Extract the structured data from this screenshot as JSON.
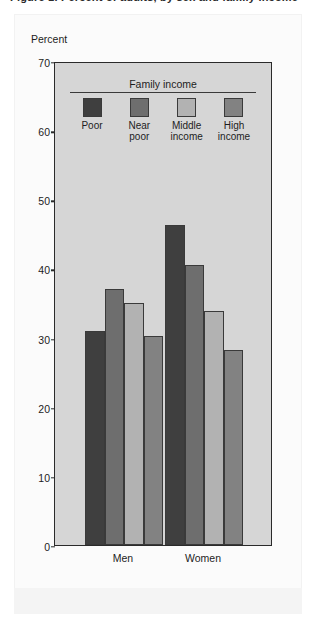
{
  "figure": {
    "clipped_title": "Figure 1. Percent of adults, by sex and family income",
    "background_color": "#fbfbfb"
  },
  "chart_data": {
    "type": "bar",
    "title": "",
    "xlabel": "",
    "ylabel": "Percent",
    "categories": [
      "Men",
      "Women"
    ],
    "series": [
      {
        "name": "Poor",
        "color": "#3f3f3f",
        "values": [
          31.0,
          46.3
        ]
      },
      {
        "name": "Near poor",
        "color": "#6e6e6e",
        "values": [
          37.0,
          40.5
        ]
      },
      {
        "name": "Middle income",
        "color": "#b2b2b2",
        "values": [
          35.0,
          33.8
        ]
      },
      {
        "name": "High income",
        "color": "#828282",
        "values": [
          30.3,
          28.2
        ]
      }
    ],
    "ylim": [
      0,
      70
    ],
    "ytick_step": 10,
    "yticks": [
      "70",
      "60",
      "50",
      "40",
      "30",
      "20",
      "10",
      "0"
    ],
    "grid": false,
    "legend_position": "inside-top-center",
    "legend_title": "Family income",
    "plot_background": "#d6d6d6",
    "axis_color": "#2a2a2a"
  },
  "legend": {
    "title": "Family income",
    "items": [
      {
        "line1": "Poor",
        "line2": "",
        "color": "#3f3f3f"
      },
      {
        "line1": "Near",
        "line2": "poor",
        "color": "#6e6e6e"
      },
      {
        "line1": "Middle",
        "line2": "income",
        "color": "#b2b2b2"
      },
      {
        "line1": "High",
        "line2": "income",
        "color": "#828282"
      }
    ]
  }
}
